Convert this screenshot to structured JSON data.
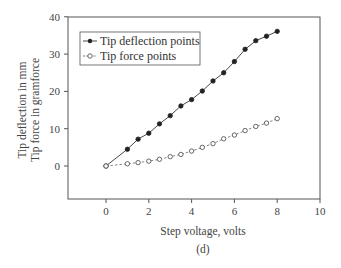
{
  "chart_data": {
    "type": "line",
    "title": "",
    "caption": "(d)",
    "xlabel": "Step voltage, volts",
    "ylabel_lines": [
      "Tip deflection in mm",
      "Tip force in gramforce"
    ],
    "xlim": [
      -1.8,
      10
    ],
    "ylim": [
      -9,
      40
    ],
    "xticks": [
      0,
      2,
      4,
      6,
      8,
      10
    ],
    "yticks": [
      0,
      10,
      20,
      30,
      40
    ],
    "grid": false,
    "legend_position": "upper left",
    "x": [
      0,
      1,
      1.5,
      2,
      2.5,
      3,
      3.5,
      4,
      4.5,
      5,
      5.5,
      6,
      6.5,
      7,
      7.5,
      8
    ],
    "series": [
      {
        "name": "Tip deflection points",
        "marker": "filled-circle",
        "line": "solid",
        "values": [
          0,
          4.5,
          7.2,
          8.8,
          11.3,
          13.5,
          16.1,
          17.8,
          20.1,
          22.8,
          25.0,
          28.0,
          31.3,
          33.6,
          34.8,
          36.1
        ]
      },
      {
        "name": "Tip force points",
        "marker": "open-circle",
        "line": "dashed",
        "values": [
          0,
          0.6,
          0.9,
          1.3,
          1.8,
          2.5,
          3.1,
          4.0,
          5.0,
          6.0,
          7.3,
          8.3,
          9.5,
          10.6,
          11.5,
          12.7
        ]
      }
    ]
  }
}
